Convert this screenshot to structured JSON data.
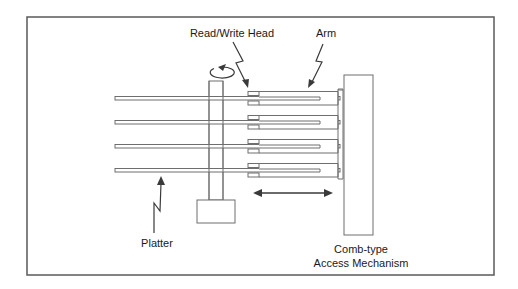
{
  "diagram": {
    "labels": {
      "read_write_head": "Read/Write Head",
      "arm": "Arm",
      "platter": "Platter",
      "access_mechanism_line1": "Comb-type",
      "access_mechanism_line2": "Access Mechanism"
    },
    "components": {
      "platter_count": 4,
      "arm_count": 4,
      "heads_per_arm": 2
    },
    "colors": {
      "stroke": "#6e6e6e",
      "arrow": "#3a3a3a",
      "frame": "#5a5a5a",
      "text": "#1a1a1a",
      "background": "#ffffff"
    }
  }
}
